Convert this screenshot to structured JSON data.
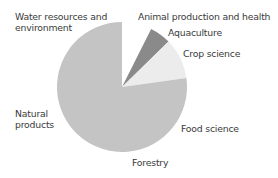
{
  "chart_data": {
    "type": "pie",
    "title": "",
    "start_angle_deg": 0,
    "direction": "clockwise",
    "slices": [
      {
        "label": "Animal production and health",
        "value": 7.4,
        "color": "#ffffff"
      },
      {
        "label": "Aquaculture",
        "value": 5.3,
        "color": "#8a8a8a"
      },
      {
        "label": "Crop science",
        "value": 10.1,
        "color": "#ececec"
      },
      {
        "label": "Food science / Forestry / Natural products / Water resources and environment",
        "value": 77.2,
        "color": "#c4c4c4"
      }
    ],
    "legend": "none (labels placed around pie)"
  },
  "labels": {
    "water": [
      "Water resources and",
      "environment"
    ],
    "animal": "Animal production and health",
    "aquaculture": "Aquaculture",
    "crop": "Crop science",
    "natural": [
      "Natural",
      "products"
    ],
    "food": "Food science",
    "forestry": "Forestry"
  }
}
